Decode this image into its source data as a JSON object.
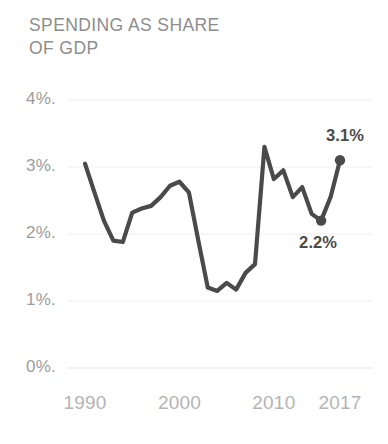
{
  "chart_data": {
    "type": "line",
    "title": "SPENDING AS SHARE\nOF GDP",
    "xlabel": "",
    "ylabel": "",
    "xlim": [
      1990,
      2017
    ],
    "ylim": [
      0,
      4
    ],
    "grid": true,
    "legend": null,
    "line_color": "#4a4a4a",
    "x_tick_labels": [
      "1990",
      "2000",
      "2010",
      "2017"
    ],
    "x_ticks": [
      1990,
      2000,
      2010,
      2017
    ],
    "y_tick_labels": [
      "4%.",
      "3%.",
      "2%.",
      "1%.",
      "0%."
    ],
    "y_ticks": [
      4,
      3,
      2,
      1,
      0
    ],
    "x": [
      1990,
      1991,
      1992,
      1993,
      1994,
      1995,
      1996,
      1997,
      1998,
      1999,
      2000,
      2001,
      2002,
      2003,
      2004,
      2005,
      2006,
      2007,
      2008,
      2009,
      2010,
      2011,
      2012,
      2013,
      2014,
      2015,
      2016,
      2017
    ],
    "values": [
      3.05,
      2.62,
      2.2,
      1.9,
      1.88,
      2.32,
      2.38,
      2.42,
      2.55,
      2.72,
      2.78,
      2.62,
      1.9,
      1.2,
      1.15,
      1.27,
      1.17,
      1.42,
      1.55,
      3.3,
      2.82,
      2.95,
      2.55,
      2.7,
      2.3,
      2.2,
      2.55,
      3.1
    ],
    "annotations": [
      {
        "label": "2.2%",
        "x": 2015,
        "y": 2.2
      },
      {
        "label": "3.1%",
        "x": 2017,
        "y": 3.1
      }
    ],
    "markers": [
      {
        "x": 2015,
        "y": 2.2
      },
      {
        "x": 2017,
        "y": 3.1
      }
    ]
  },
  "colors": {
    "line": "#4a4a4a",
    "grid": "#f0f0f0",
    "title_text": "#8d8d8d",
    "y_tick_text": "#9d9d9d",
    "x_tick_text": "#b4b4b4",
    "annotation_text": "#4a4a4a",
    "background": "#ffffff"
  }
}
